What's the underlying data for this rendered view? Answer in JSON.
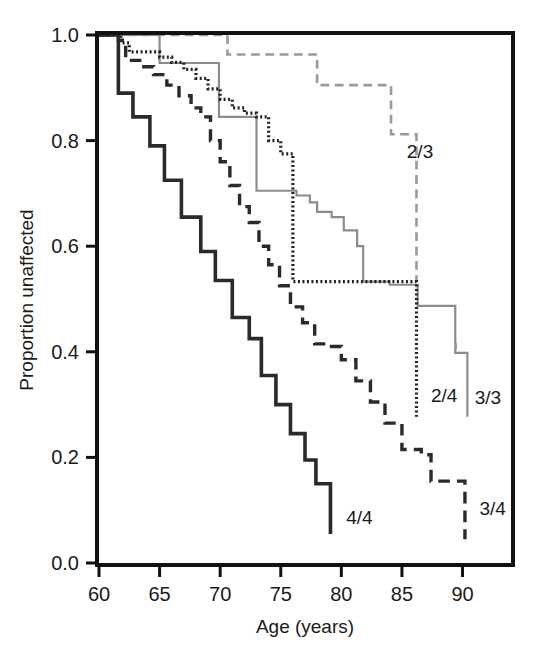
{
  "chart_data": {
    "type": "line",
    "title": "",
    "subtitle": "",
    "xlabel": "Age (years)",
    "ylabel": "Proportion unaffected",
    "xlim": [
      60,
      94
    ],
    "ylim": [
      0.0,
      1.0
    ],
    "xticks": [
      "60",
      "65",
      "70",
      "75",
      "80",
      "85",
      "90"
    ],
    "xtick_values": [
      60,
      65,
      70,
      75,
      80,
      85,
      90
    ],
    "yticks": [
      "0.0",
      "0.2",
      "0.4",
      "0.6",
      "0.8",
      "1.0"
    ],
    "ytick_values": [
      0.0,
      0.2,
      0.4,
      0.6,
      0.8,
      1.0
    ],
    "grid": false,
    "legend_position": "inline-curve-end-labels",
    "step_style": "post",
    "series": [
      {
        "name": "2/3",
        "label": "2/3",
        "style": "dashed",
        "color": "#9a9a9a",
        "width": 2.6,
        "label_x": 85.4,
        "label_y": 0.78,
        "x": [
          60.0,
          65.0,
          69.6,
          70.6,
          74.3,
          78.0,
          84.1,
          84.1,
          86.2,
          86.2
        ],
        "y": [
          1.0,
          1.0,
          1.0,
          0.963,
          0.963,
          0.905,
          0.905,
          0.812,
          0.812,
          0.535
        ]
      },
      {
        "name": "3/3",
        "label": "3/3",
        "style": "solid",
        "color": "#8c8c8c",
        "width": 2.2,
        "label_x": 91.0,
        "label_y": 0.315,
        "x": [
          60.0,
          65.0,
          65.0,
          69.9,
          69.9,
          73.0,
          73.0,
          76.0,
          76.3,
          77.4,
          78.0,
          79.2,
          80.2,
          81.3,
          81.8,
          82.0,
          84.0,
          86.3,
          86.3,
          89.4,
          89.4,
          90.4,
          90.4
        ],
        "y": [
          1.0,
          1.0,
          0.947,
          0.947,
          0.845,
          0.845,
          0.705,
          0.705,
          0.696,
          0.683,
          0.665,
          0.655,
          0.63,
          0.6,
          0.533,
          0.533,
          0.527,
          0.527,
          0.487,
          0.487,
          0.398,
          0.398,
          0.277
        ]
      },
      {
        "name": "2/4",
        "label": "2/4",
        "style": "dotted",
        "color": "#222222",
        "width": 3.2,
        "label_x": 87.4,
        "label_y": 0.318,
        "x": [
          60.0,
          61.8,
          62.5,
          64.0,
          65.0,
          66.0,
          67.0,
          68.0,
          69.0,
          70.0,
          71.0,
          72.0,
          73.0,
          74.0,
          75.0,
          76.0,
          76.0,
          82.0,
          86.2,
          86.2
        ],
        "y": [
          1.0,
          0.985,
          0.968,
          0.968,
          0.958,
          0.948,
          0.935,
          0.918,
          0.898,
          0.878,
          0.862,
          0.852,
          0.845,
          0.8,
          0.775,
          0.718,
          0.533,
          0.533,
          0.533,
          0.277
        ]
      },
      {
        "name": "3/4",
        "label": "3/4",
        "style": "dashed",
        "color": "#2a2a2a",
        "width": 3.4,
        "label_x": 91.4,
        "label_y": 0.105,
        "x": [
          60.0,
          61.6,
          62.2,
          63.5,
          64.5,
          65.6,
          66.6,
          67.6,
          68.4,
          69.2,
          70.0,
          70.8,
          71.6,
          72.4,
          73.2,
          74.0,
          74.9,
          75.8,
          76.8,
          77.8,
          78.8,
          80.0,
          81.2,
          82.4,
          83.6,
          85.0,
          86.6,
          87.4,
          90.2,
          90.2
        ],
        "y": [
          1.0,
          0.99,
          0.952,
          0.94,
          0.925,
          0.905,
          0.885,
          0.862,
          0.845,
          0.8,
          0.76,
          0.715,
          0.675,
          0.645,
          0.6,
          0.565,
          0.525,
          0.485,
          0.455,
          0.415,
          0.41,
          0.385,
          0.345,
          0.305,
          0.265,
          0.215,
          0.205,
          0.155,
          0.12,
          0.045
        ]
      },
      {
        "name": "4/4",
        "label": "4/4",
        "style": "solid",
        "color": "#2a2a2a",
        "width": 3.6,
        "label_x": 80.4,
        "label_y": 0.088,
        "x": [
          60.0,
          61.6,
          61.6,
          62.8,
          62.8,
          64.2,
          64.2,
          65.4,
          65.4,
          66.8,
          66.8,
          68.4,
          68.4,
          69.6,
          69.6,
          71.0,
          71.0,
          72.4,
          72.4,
          73.4,
          73.4,
          74.6,
          74.6,
          75.8,
          75.8,
          77.0,
          77.0,
          77.9,
          77.9,
          79.1,
          79.1
        ],
        "y": [
          1.0,
          1.0,
          0.89,
          0.89,
          0.845,
          0.845,
          0.79,
          0.79,
          0.725,
          0.725,
          0.655,
          0.655,
          0.59,
          0.59,
          0.535,
          0.535,
          0.465,
          0.465,
          0.425,
          0.425,
          0.355,
          0.355,
          0.3,
          0.3,
          0.245,
          0.245,
          0.195,
          0.195,
          0.15,
          0.15,
          0.055
        ]
      }
    ]
  },
  "axes": {
    "x_label": "Age (years)",
    "y_label": "Proportion unaffected"
  },
  "colors": {
    "frame": "#111111",
    "text": "#1a1a1a",
    "light_gray": "#9a9a9a",
    "mid_gray": "#8c8c8c",
    "dark": "#2a2a2a"
  }
}
